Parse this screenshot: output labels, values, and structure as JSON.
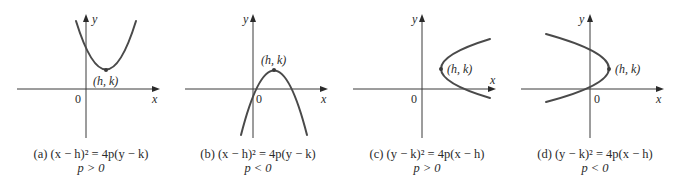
{
  "figure": {
    "panels": [
      {
        "id": "a",
        "axis_x_label": "x",
        "axis_y_label": "y",
        "origin_label": "0",
        "vertex_label": "(h, k)",
        "caption_equation": "(a)  (x − h)² = 4p(y − k)",
        "caption_condition": "p > 0",
        "orientation": "opens-up"
      },
      {
        "id": "b",
        "axis_x_label": "x",
        "axis_y_label": "y",
        "origin_label": "0",
        "vertex_label": "(h, k)",
        "caption_equation": "(b)  (x − h)² = 4p(y − k)",
        "caption_condition": "p < 0",
        "orientation": "opens-down"
      },
      {
        "id": "c",
        "axis_x_label": "x",
        "axis_y_label": "y",
        "origin_label": "0",
        "vertex_label": "(h, k)",
        "caption_equation": "(c)  (y − k)² = 4p(x − h)",
        "caption_condition": "p > 0",
        "orientation": "opens-right"
      },
      {
        "id": "d",
        "axis_x_label": "x",
        "axis_y_label": "y",
        "origin_label": "0",
        "vertex_label": "(h, k)",
        "caption_equation": "(d)  (y − k)² = 4p(x − h)",
        "caption_condition": "p < 0",
        "orientation": "opens-left"
      }
    ],
    "colors": {
      "curve": "#4a4a4a",
      "axis": "#3a3a3a",
      "text": "#2a2a2a",
      "background": "#ffffff"
    }
  }
}
